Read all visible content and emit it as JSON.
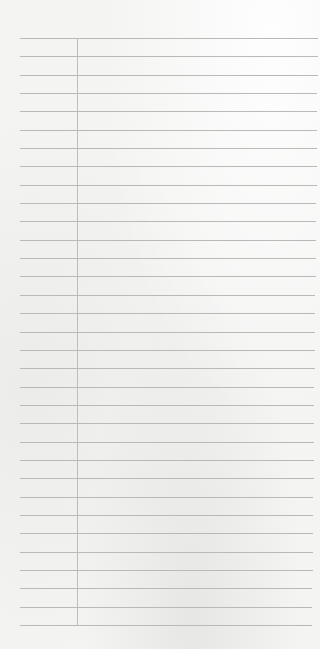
{
  "page": {
    "type": "ruled-notepad-sheet",
    "content_text": ""
  },
  "colors": {
    "paper": "#f4f4f3",
    "rule_line": "#b9b9b8",
    "margin_line": "#bdbdbc"
  },
  "rules": {
    "count": 33,
    "first_y": 38,
    "last_y": 625,
    "left_x": 20,
    "right_x_top": 318,
    "right_x_bottom": 312
  },
  "margin": {
    "x": 77,
    "top_y": 38,
    "bottom_y": 625
  }
}
